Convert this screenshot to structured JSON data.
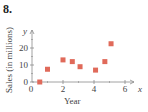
{
  "problem_number": "8.",
  "chart_data": {
    "type": "scatter",
    "title": "",
    "xlabel": "Year",
    "ylabel": "Sales (in millions)",
    "x_var": "x",
    "y_var": "y",
    "xlim": [
      0,
      6.5
    ],
    "ylim": [
      0,
      28
    ],
    "xticks": [
      0,
      2,
      4,
      6
    ],
    "yticks": [
      0,
      10,
      20
    ],
    "grid": false,
    "marker": "square",
    "marker_color": "#e06a5a",
    "points": [
      {
        "x": 0.5,
        "y": 0
      },
      {
        "x": 1.0,
        "y": 7.5
      },
      {
        "x": 2.0,
        "y": 13
      },
      {
        "x": 2.6,
        "y": 12
      },
      {
        "x": 3.1,
        "y": 9
      },
      {
        "x": 4.1,
        "y": 7
      },
      {
        "x": 4.7,
        "y": 12
      },
      {
        "x": 5.1,
        "y": 22.5
      }
    ]
  }
}
